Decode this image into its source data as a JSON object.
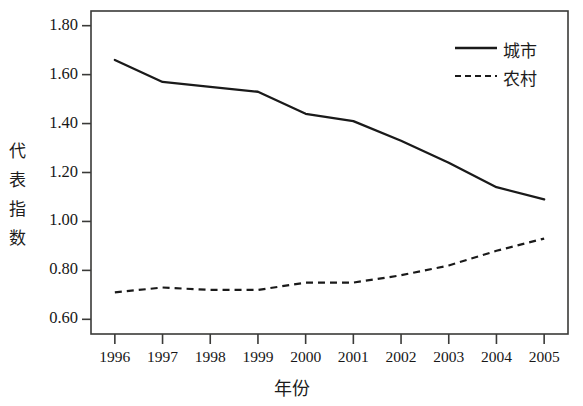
{
  "chart_data": {
    "type": "line",
    "title": "",
    "xlabel": "年份",
    "ylabel": "代表指数",
    "x": [
      1996,
      1997,
      1998,
      1999,
      2000,
      2001,
      2002,
      2003,
      2004,
      2005
    ],
    "categories": [
      "1996",
      "1997",
      "1998",
      "1999",
      "2000",
      "2001",
      "2002",
      "2003",
      "2004",
      "2005"
    ],
    "series": [
      {
        "name": "城市",
        "style": "solid",
        "color": "#1a1a1a",
        "values": [
          1.66,
          1.57,
          1.55,
          1.53,
          1.44,
          1.41,
          1.33,
          1.24,
          1.14,
          1.09
        ]
      },
      {
        "name": "农村",
        "style": "dashed",
        "color": "#1a1a1a",
        "values": [
          0.71,
          0.73,
          0.72,
          0.72,
          0.75,
          0.75,
          0.78,
          0.82,
          0.88,
          0.93
        ]
      }
    ],
    "ylim": [
      0.54,
      1.86
    ],
    "yticks": [
      0.6,
      0.8,
      1.0,
      1.2,
      1.4,
      1.6,
      1.8
    ],
    "ytick_labels": [
      "0.60",
      "0.80",
      "1.00",
      "1.20",
      "1.40",
      "1.60",
      "1.80"
    ],
    "xtick_labels": [
      "1996",
      "1997",
      "1998",
      "1999",
      "2000",
      "2001",
      "2002",
      "2003",
      "2004",
      "2005"
    ],
    "grid": false,
    "legend_position": "top-right",
    "legend_entries": [
      "城市",
      "农村"
    ],
    "frame": "box"
  },
  "axis": {
    "y_title": "代表指数",
    "x_title": "年份"
  },
  "legend": {
    "urban_label": "城市",
    "rural_label": "农村"
  }
}
